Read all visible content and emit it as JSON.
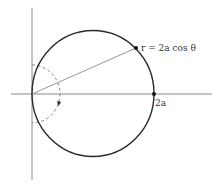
{
  "diagram": {
    "type": "polar-curve",
    "equation_label": "r = 2a cos θ",
    "point_label": "2a",
    "colors": {
      "curve": "#2a2a2a",
      "axes": "#8a8a8a",
      "radius_line": "#8a8a8a",
      "angle_arc": "#777777",
      "labels": "#333333"
    },
    "elements": [
      {
        "kind": "x-axis"
      },
      {
        "kind": "y-axis"
      },
      {
        "kind": "circle",
        "description": "circle r = 2a cos θ, tangent to y-axis at origin"
      },
      {
        "kind": "radius-line",
        "description": "line from origin to point on circle"
      },
      {
        "kind": "point",
        "label": "r = 2a cos θ"
      },
      {
        "kind": "point",
        "label": "2a"
      },
      {
        "kind": "dashed-arc",
        "description": "dashed semicircle showing θ sweeping from π/2 to -π/2, with arrow"
      }
    ]
  }
}
